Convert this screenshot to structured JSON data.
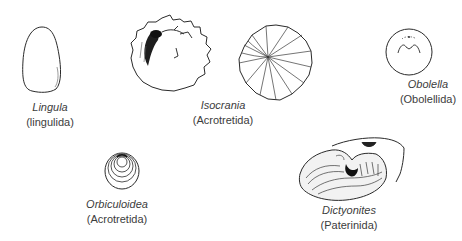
{
  "figure": {
    "specimens": [
      {
        "id": "lingula",
        "genus": "Lingula",
        "order": "(lingulida)"
      },
      {
        "id": "isocrania",
        "genus": "Isocrania",
        "order": "(Acrotretida)"
      },
      {
        "id": "obolella",
        "genus": "Obolella",
        "order": "(Obolellida)"
      },
      {
        "id": "orbiculoidea",
        "genus": "Orbiculoidea",
        "order": "(Acrotretida)"
      },
      {
        "id": "dictyonites",
        "genus": "Dictyonites",
        "order": "(Paterinida)"
      }
    ]
  },
  "colors": {
    "background": "#ffffff",
    "ink": "#2a2a2a",
    "text": "#3c3c3c"
  }
}
